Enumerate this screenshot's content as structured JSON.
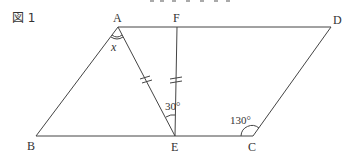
{
  "figure": {
    "label": "図 1",
    "shape": "parallelogram ABCD with segments AE and FE",
    "points": {
      "A": {
        "label": "A",
        "x": 118,
        "y": 27
      },
      "F": {
        "label": "F",
        "x": 177,
        "y": 27
      },
      "D": {
        "label": "D",
        "x": 331,
        "y": 27
      },
      "B": {
        "label": "B",
        "x": 36,
        "y": 136
      },
      "E": {
        "label": "E",
        "x": 175,
        "y": 136
      },
      "C": {
        "label": "C",
        "x": 253,
        "y": 136
      }
    },
    "angles": {
      "AEF": "30°",
      "BCD": "130°",
      "BAE": "x"
    },
    "equal_marks": "AE = FE (double tick marks)",
    "colors": {
      "line": "#444444",
      "text": "#333333"
    }
  }
}
